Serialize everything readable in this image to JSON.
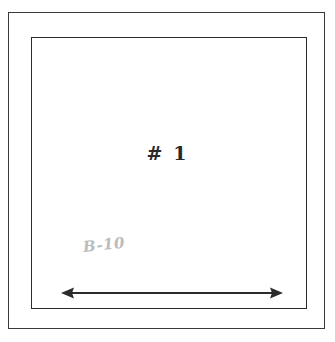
{
  "figure": {
    "type": "technical-sketch",
    "background_color": "#ffffff",
    "line_color": "#2b2b2b",
    "outer_frame": {
      "name": "outer-rectangle",
      "x": 8,
      "y": 12,
      "width": 317,
      "height": 317,
      "stroke_color": "#3a3a3a",
      "stroke_width": 1.4
    },
    "inner_frame": {
      "name": "inner-rectangle",
      "x": 31,
      "y": 37,
      "width": 276,
      "height": 272,
      "stroke_color": "#2b2b2b",
      "stroke_width": 1.8
    }
  },
  "labels": {
    "panel_label": "# 1",
    "pencil_annotation": "B-10"
  },
  "annotations": {
    "dimension_arrow": {
      "name": "horizontal-double-arrow",
      "direction": "double-headed-horizontal",
      "x_start": 63,
      "x_end": 281,
      "y": 293,
      "length_px": 218,
      "color": "#2b2b2b",
      "stroke_width": 2
    }
  },
  "colors": {
    "ink": "#2b2b2b",
    "frame": "#3a3a3a",
    "pencil": "#b9b9bb",
    "paper": "#ffffff"
  }
}
